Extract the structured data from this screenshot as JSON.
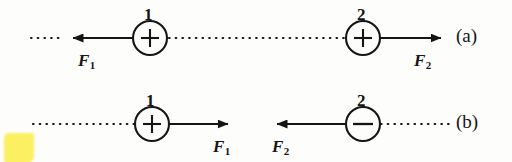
{
  "figure": {
    "background_color": "#fdfdfb",
    "ink_color": "#151515",
    "highlight_color": "#fbf05a"
  },
  "rows": [
    {
      "id": "a",
      "label": "(a)",
      "description": "Two like (positive) charges repel: forces point away from each other",
      "charges": [
        {
          "number": "1",
          "sign": "+",
          "cx": 150,
          "cy": 38,
          "r": 17
        },
        {
          "number": "2",
          "sign": "+",
          "cx": 363,
          "cy": 38,
          "r": 17
        }
      ],
      "forces": [
        {
          "name": "F",
          "subscript": "1",
          "label": "F1",
          "direction": "left",
          "tail_x": 133,
          "head_x": 62,
          "y": 38
        },
        {
          "name": "F",
          "subscript": "2",
          "label": "F2",
          "direction": "right",
          "tail_x": 380,
          "head_x": 452,
          "y": 38
        }
      ],
      "dotted_segments": [
        {
          "x1": 31,
          "x2": 61,
          "y": 38
        },
        {
          "x1": 169,
          "x2": 345,
          "y": 38
        }
      ]
    },
    {
      "id": "b",
      "label": "(b)",
      "description": "Unlike charges (positive and negative) attract: forces point toward each other",
      "charges": [
        {
          "number": "1",
          "sign": "+",
          "cx": 152,
          "cy": 124,
          "r": 17
        },
        {
          "number": "2",
          "sign": "−",
          "cx": 363,
          "cy": 124,
          "r": 17
        }
      ],
      "forces": [
        {
          "name": "F",
          "subscript": "1",
          "label": "F1",
          "direction": "right",
          "tail_x": 169,
          "head_x": 239,
          "y": 124
        },
        {
          "name": "F",
          "subscript": "2",
          "label": "F2",
          "direction": "left",
          "tail_x": 346,
          "head_x": 266,
          "y": 124
        }
      ],
      "dotted_segments": [
        {
          "x1": 33,
          "x2": 134,
          "y": 124
        },
        {
          "x1": 381,
          "x2": 451,
          "y": 124
        }
      ]
    }
  ],
  "labels": {
    "charge_a1_number": "1",
    "charge_a2_number": "2",
    "charge_b1_number": "1",
    "charge_b2_number": "2",
    "sign_a1": "+",
    "sign_a2": "+",
    "sign_b1": "+",
    "sign_b2": "−",
    "force_a1_name": "F",
    "force_a1_sub": "1",
    "force_a2_name": "F",
    "force_a2_sub": "2",
    "force_b1_name": "F",
    "force_b1_sub": "1",
    "force_b2_name": "F",
    "force_b2_sub": "2",
    "row_a": "(a)",
    "row_b": "(b)"
  }
}
